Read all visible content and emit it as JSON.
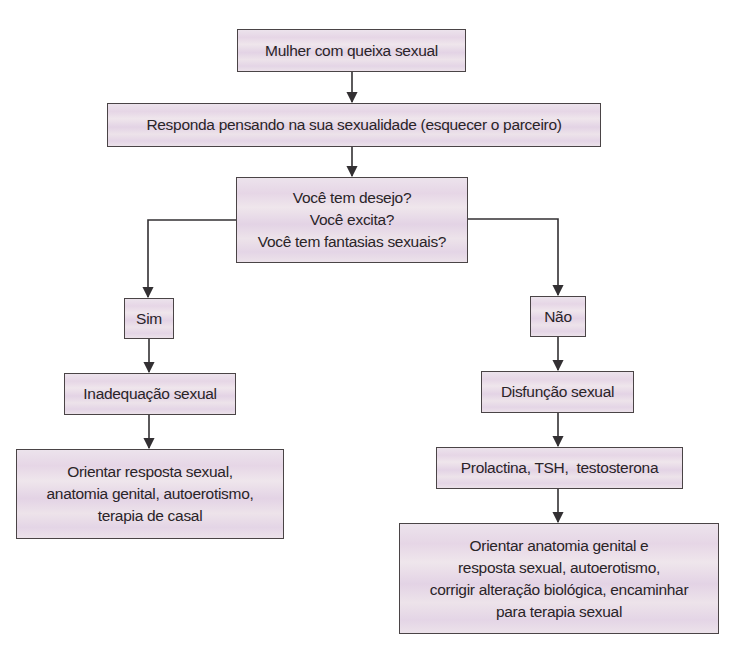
{
  "diagram": {
    "type": "flowchart",
    "colors": {
      "node_fill": "#e9dde9",
      "node_border": "#4a4446",
      "edge": "#333033",
      "text": "#2a2428"
    },
    "nodes": {
      "start": {
        "lines": [
          "Mulher com queixa sexual"
        ]
      },
      "instruction": {
        "lines": [
          "Responda pensando na sua sexualidade (esquecer o parceiro)"
        ]
      },
      "question": {
        "lines": [
          "Você tem desejo?",
          "Você excita?",
          "Você tem fantasias sexuais?"
        ]
      },
      "yes": {
        "lines": [
          "Sim"
        ]
      },
      "no": {
        "lines": [
          "Não"
        ]
      },
      "inadequacy": {
        "lines": [
          "Inadequação sexual"
        ]
      },
      "dysfunction": {
        "lines": [
          "Disfunção sexual"
        ]
      },
      "yes_action": {
        "lines": [
          "Orientar resposta sexual,",
          "anatomia genital, autoerotismo,",
          "terapia de casal"
        ]
      },
      "labs": {
        "lines": [
          "Prolactina, TSH,  testosterona"
        ]
      },
      "no_action": {
        "lines": [
          "Orientar anatomia genital e",
          "resposta sexual, autoerotismo,",
          "corrigir alteração biológica, encaminhar",
          "para terapia sexual"
        ]
      }
    },
    "edges": [
      {
        "from": "start",
        "to": "instruction"
      },
      {
        "from": "instruction",
        "to": "question"
      },
      {
        "from": "question",
        "to": "yes"
      },
      {
        "from": "question",
        "to": "no"
      },
      {
        "from": "yes",
        "to": "inadequacy"
      },
      {
        "from": "inadequacy",
        "to": "yes_action"
      },
      {
        "from": "no",
        "to": "dysfunction"
      },
      {
        "from": "dysfunction",
        "to": "labs"
      },
      {
        "from": "labs",
        "to": "no_action"
      }
    ]
  }
}
